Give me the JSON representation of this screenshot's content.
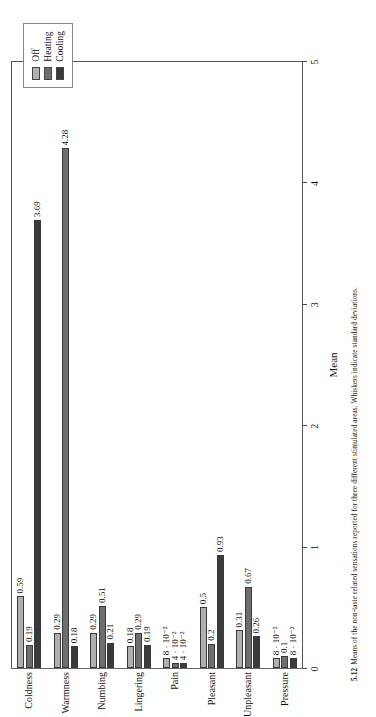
{
  "figure": {
    "caption_number": "5.12",
    "caption_text": "Means of the non-taste related sensations reported for three different stimulated areas. Whiskers indicate standard deviations."
  },
  "legend": {
    "title": "",
    "items": [
      {
        "label": "Off",
        "color": "#b0b0b0"
      },
      {
        "label": "Heating",
        "color": "#6e6e6e"
      },
      {
        "label": "Cooling",
        "color": "#3a3a3a"
      }
    ]
  },
  "axis": {
    "value_axis_title": "Mean",
    "ticks": [
      "0",
      "1",
      "2",
      "3",
      "4",
      "5"
    ],
    "min": 0,
    "max": 5
  },
  "chart_data": {
    "type": "bar",
    "orientation": "horizontal",
    "title": "",
    "xlabel": "Mean",
    "ylabel": "",
    "xlim": [
      0,
      5
    ],
    "grid": false,
    "legend_position": "top-left",
    "categories": [
      "Coldness",
      "Warmness",
      "Numbing",
      "Lingering",
      "Pain",
      "Pleasant",
      "Unpleasant",
      "Pressure"
    ],
    "series": [
      {
        "name": "Off",
        "color": "#b0b0b0",
        "values": [
          0.59,
          0.29,
          0.29,
          0.18,
          0.08,
          0.5,
          0.31,
          0.08
        ],
        "labels": [
          "0.59",
          "0.29",
          "0.29",
          "0.18",
          "8 · 10⁻²",
          "0.5",
          "0.31",
          "8 · 10⁻²"
        ]
      },
      {
        "name": "Heating",
        "color": "#6e6e6e",
        "values": [
          0.19,
          4.28,
          0.51,
          0.29,
          0.04,
          0.2,
          0.67,
          0.1
        ],
        "labels": [
          "0.19",
          "4.28",
          "0.51",
          "0.29",
          "4 · 10⁻²",
          "0.2",
          "0.67",
          "0.1"
        ]
      },
      {
        "name": "Cooling",
        "color": "#3a3a3a",
        "values": [
          3.69,
          0.18,
          0.21,
          0.19,
          0.04,
          0.93,
          0.26,
          0.08
        ],
        "labels": [
          "3.69",
          "0.18",
          "0.21",
          "0.19",
          "4 · 10⁻²",
          "0.93",
          "0.26",
          "8 · 10⁻²"
        ]
      }
    ]
  }
}
